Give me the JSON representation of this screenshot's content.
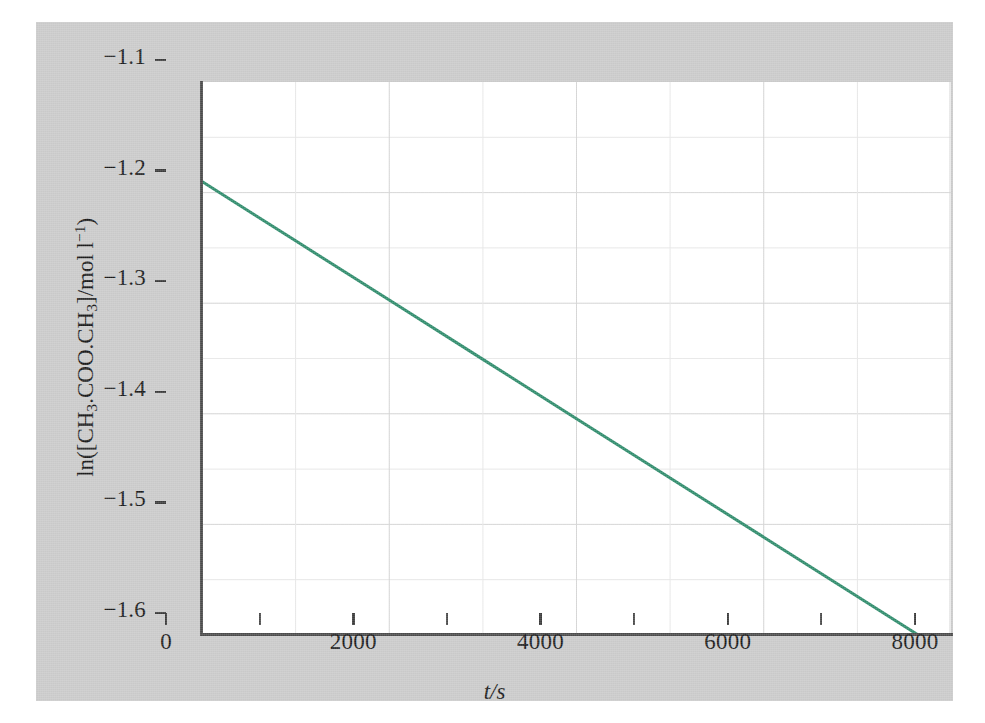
{
  "figure": {
    "background_color": "#c9c9c9",
    "plot_background_color": "#ffffff",
    "axis_color": "#4a4a4a",
    "grid_color": "#d6d6d6"
  },
  "chart_data": {
    "type": "line",
    "title": "",
    "subtitle": "",
    "xlabel": "t/s",
    "ylabel": "ln([CH3.COO.CH3]/mol l-1)",
    "ylabel_parts": {
      "prefix": "ln([CH",
      "sub1": "3",
      "mid1": ".COO.CH",
      "sub2": "3",
      "mid2": "]/mol l",
      "sup1": "−1",
      "suffix": ")"
    },
    "xlim": [
      0,
      8000
    ],
    "ylim": [
      -1.6,
      -1.1
    ],
    "grid": true,
    "grid_minor": true,
    "legend": "none",
    "line_color": "#2e8b6b",
    "line_width": 3,
    "xticks": [
      0,
      2000,
      4000,
      6000,
      8000
    ],
    "xtick_labels": [
      "0",
      "2000",
      "4000",
      "6000",
      "8000"
    ],
    "xticks_minor": [
      1000,
      3000,
      5000,
      7000
    ],
    "yticks": [
      -1.1,
      -1.2,
      -1.3,
      -1.4,
      -1.5,
      -1.6
    ],
    "ytick_labels": [
      "−1.1",
      "−1.2",
      "−1.3",
      "−1.4",
      "−1.5",
      "−1.6"
    ],
    "series": [
      {
        "name": "ln[ester] vs time",
        "x": [
          0,
          1000,
          2000,
          3000,
          4000,
          5000,
          6000,
          7000,
          7650
        ],
        "y": [
          -1.19,
          -1.2436,
          -1.2972,
          -1.3508,
          -1.4044,
          -1.458,
          -1.5116,
          -1.5652,
          -1.6
        ],
        "slope_per_second": -5.36e-05,
        "intercept": -1.19,
        "endpoint_x": 7650,
        "endpoint_y": -1.6
      }
    ],
    "annotations": []
  }
}
